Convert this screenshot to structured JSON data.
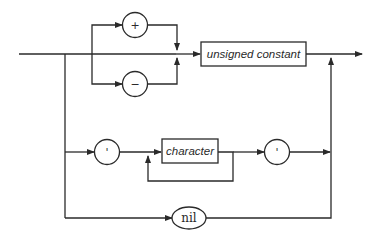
{
  "diagram": {
    "type": "syntax-diagram",
    "nodes": {
      "plus": {
        "kind": "terminal-circle",
        "label": "+"
      },
      "minus": {
        "kind": "terminal-circle",
        "label": "−"
      },
      "unsigned_constant": {
        "kind": "nonterminal-box",
        "label": "unsigned constant"
      },
      "quote_open": {
        "kind": "terminal-circle",
        "label": "'"
      },
      "character": {
        "kind": "nonterminal-box",
        "label": "character"
      },
      "quote_close": {
        "kind": "terminal-circle",
        "label": "'"
      },
      "nil": {
        "kind": "terminal-oval",
        "label": "nil"
      }
    },
    "paths": [
      "entry → (optional + | −) → unsigned constant → exit",
      "entry → ' → character (repeat) → ' → exit",
      "entry → nil → exit"
    ]
  }
}
